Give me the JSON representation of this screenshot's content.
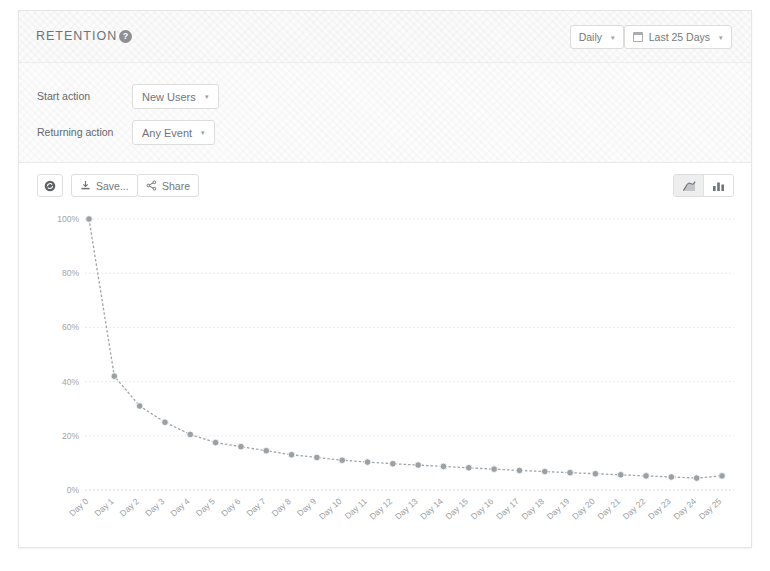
{
  "header": {
    "title": "RETENTION",
    "help_icon": "question-mark-icon",
    "interval": {
      "label": "Daily",
      "caret": "▾"
    },
    "daterange": {
      "label": "Last 25 Days",
      "caret": "▾",
      "icon": "calendar-icon"
    }
  },
  "filters": {
    "start_action": {
      "label": "Start action",
      "value": "New Users",
      "caret": "▾"
    },
    "returning_action": {
      "label": "Returning action",
      "value": "Any Event",
      "caret": "▾"
    }
  },
  "toolbar": {
    "refresh_label": "",
    "save_label": "Save...",
    "share_label": "Share",
    "chart_type": {
      "line_label": "",
      "bar_label": "",
      "active": "line"
    }
  },
  "chart_data": {
    "type": "line",
    "title": "",
    "xlabel": "",
    "ylabel": "",
    "ylim": [
      0,
      100
    ],
    "grid": true,
    "legend": false,
    "yticks": [
      "0%",
      "20%",
      "40%",
      "60%",
      "80%",
      "100%"
    ],
    "ytick_values": [
      0,
      20,
      40,
      60,
      80,
      100
    ],
    "categories": [
      "Day 0",
      "Day 1",
      "Day 2",
      "Day 3",
      "Day 4",
      "Day 5",
      "Day 6",
      "Day 7",
      "Day 8",
      "Day 9",
      "Day 10",
      "Day 11",
      "Day 12",
      "Day 13",
      "Day 14",
      "Day 15",
      "Day 16",
      "Day 17",
      "Day 18",
      "Day 19",
      "Day 20",
      "Day 21",
      "Day 22",
      "Day 23",
      "Day 24",
      "Day 25"
    ],
    "series": [
      {
        "name": "Retention",
        "values": [
          100,
          42,
          31,
          25,
          20.5,
          17.5,
          16,
          14.5,
          13,
          12,
          11,
          10.3,
          9.7,
          9.2,
          8.7,
          8.2,
          7.7,
          7.2,
          6.8,
          6.4,
          6.0,
          5.6,
          5.2,
          4.8,
          4.4,
          5.2
        ]
      }
    ]
  }
}
